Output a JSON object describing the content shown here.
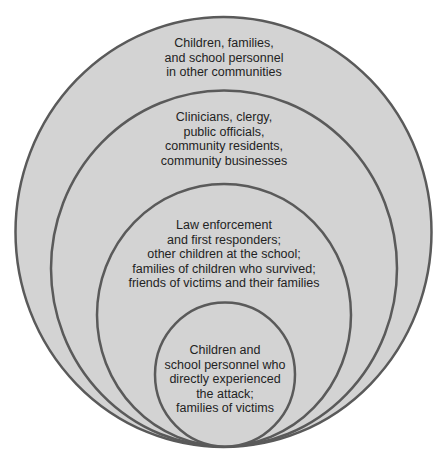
{
  "diagram": {
    "type": "nested-circles",
    "colors": {
      "background": "#ffffff",
      "fill": "#d3d3d3",
      "stroke": "#5a5a5a",
      "text": "#232323"
    },
    "rings": [
      {
        "level": 1,
        "name": "outer",
        "label": "Children, families,\nand school personnel\nin other communities"
      },
      {
        "level": 2,
        "name": "community",
        "label": "Clinicians, clergy,\npublic officials,\ncommunity residents,\ncommunity businesses"
      },
      {
        "level": 3,
        "name": "responders",
        "label": "Law enforcement\nand first responders;\nother children at the school;\nfamilies of children who survived;\nfriends of victims and their families"
      },
      {
        "level": 4,
        "name": "inner",
        "label": "Children and\nschool personnel who\ndirectly experienced\nthe attack;\nfamilies of victims"
      }
    ]
  }
}
